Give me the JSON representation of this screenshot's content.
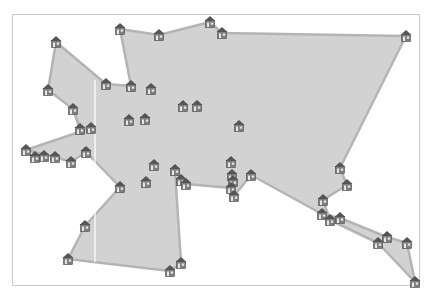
{
  "diagram": {
    "type": "polygon-map",
    "frame": {
      "x": 12,
      "y": 14,
      "width": 408,
      "height": 272,
      "border_color": "#c8c8c8"
    },
    "polygon": {
      "fill": "#d2d2d2",
      "stroke": "#b4b4b4",
      "stroke_width": 2.5,
      "points": [
        [
          56,
          42
        ],
        [
          106,
          84
        ],
        [
          131,
          86
        ],
        [
          120,
          29
        ],
        [
          159,
          35
        ],
        [
          210,
          22
        ],
        [
          222,
          33
        ],
        [
          406,
          36
        ],
        [
          340,
          168
        ],
        [
          347,
          185
        ],
        [
          323,
          200
        ],
        [
          330,
          220
        ],
        [
          378,
          243
        ],
        [
          415,
          282
        ],
        [
          407,
          243
        ],
        [
          387,
          237
        ],
        [
          340,
          218
        ],
        [
          322,
          214
        ],
        [
          251,
          175
        ],
        [
          234,
          196
        ],
        [
          231,
          188
        ],
        [
          186,
          184
        ],
        [
          181,
          180
        ],
        [
          175,
          170
        ],
        [
          181,
          263
        ],
        [
          170,
          271
        ],
        [
          68,
          259
        ],
        [
          85,
          226
        ],
        [
          120,
          187
        ],
        [
          86,
          152
        ],
        [
          71,
          162
        ],
        [
          55,
          157
        ],
        [
          26,
          150
        ],
        [
          91,
          128
        ],
        [
          80,
          129
        ],
        [
          73,
          109
        ],
        [
          48,
          90
        ]
      ]
    },
    "guide_line": {
      "x": 95,
      "y1": 80,
      "y2": 262,
      "color": "#ffffff"
    },
    "icon": {
      "name": "house-icon",
      "color_roof": "#555555",
      "color_body": "#8a8a8a",
      "color_detail": "#e8e8e8"
    },
    "houses": [
      {
        "x": 120,
        "y": 29
      },
      {
        "x": 159,
        "y": 35
      },
      {
        "x": 210,
        "y": 22
      },
      {
        "x": 222,
        "y": 33
      },
      {
        "x": 406,
        "y": 36
      },
      {
        "x": 56,
        "y": 42
      },
      {
        "x": 48,
        "y": 90
      },
      {
        "x": 106,
        "y": 84
      },
      {
        "x": 131,
        "y": 86
      },
      {
        "x": 151,
        "y": 89
      },
      {
        "x": 73,
        "y": 109
      },
      {
        "x": 183,
        "y": 106
      },
      {
        "x": 197,
        "y": 106
      },
      {
        "x": 129,
        "y": 120
      },
      {
        "x": 145,
        "y": 119
      },
      {
        "x": 239,
        "y": 126
      },
      {
        "x": 80,
        "y": 129
      },
      {
        "x": 91,
        "y": 128
      },
      {
        "x": 26,
        "y": 150
      },
      {
        "x": 35,
        "y": 157
      },
      {
        "x": 44,
        "y": 156
      },
      {
        "x": 55,
        "y": 157
      },
      {
        "x": 71,
        "y": 162
      },
      {
        "x": 86,
        "y": 152
      },
      {
        "x": 154,
        "y": 165
      },
      {
        "x": 175,
        "y": 170
      },
      {
        "x": 181,
        "y": 180
      },
      {
        "x": 186,
        "y": 184
      },
      {
        "x": 146,
        "y": 182
      },
      {
        "x": 120,
        "y": 187
      },
      {
        "x": 231,
        "y": 162
      },
      {
        "x": 232,
        "y": 175
      },
      {
        "x": 233,
        "y": 181
      },
      {
        "x": 251,
        "y": 175
      },
      {
        "x": 231,
        "y": 188
      },
      {
        "x": 234,
        "y": 196
      },
      {
        "x": 340,
        "y": 168
      },
      {
        "x": 347,
        "y": 185
      },
      {
        "x": 323,
        "y": 200
      },
      {
        "x": 322,
        "y": 214
      },
      {
        "x": 330,
        "y": 220
      },
      {
        "x": 340,
        "y": 218
      },
      {
        "x": 387,
        "y": 237
      },
      {
        "x": 378,
        "y": 243
      },
      {
        "x": 407,
        "y": 243
      },
      {
        "x": 415,
        "y": 282
      },
      {
        "x": 85,
        "y": 226
      },
      {
        "x": 68,
        "y": 259
      },
      {
        "x": 181,
        "y": 263
      },
      {
        "x": 170,
        "y": 271
      }
    ]
  }
}
